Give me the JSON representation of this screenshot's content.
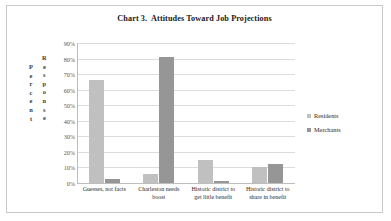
{
  "chart_data": {
    "type": "bar",
    "title": "Chart 3.  Attitudes Toward Job Projections",
    "xlabel": "",
    "ylabel": "Percent Response",
    "ylabel_lines": [
      "Percent",
      "Response"
    ],
    "categories": [
      "Guesses, not facts",
      "Charleston needs boost",
      "Historic district to get little benefit",
      "Historic district to share in benefit"
    ],
    "category_lines": [
      [
        "Guesses, not facts"
      ],
      [
        "Charleston needs",
        "boost"
      ],
      [
        "Historic district to",
        "get little benefit"
      ],
      [
        "Historic district to",
        "share in benefit"
      ]
    ],
    "series": [
      {
        "name": "Residents",
        "color": "#c0c0c0",
        "values": [
          66,
          5.5,
          15,
          10
        ]
      },
      {
        "name": "Merchants",
        "color": "#969696",
        "values": [
          2.5,
          81,
          1.5,
          12
        ]
      }
    ],
    "ylim": [
      0,
      90
    ],
    "ytick_step": 10,
    "ytick_labels": [
      "90%",
      "80%",
      "70%",
      "60%",
      "50%",
      "40%",
      "30%",
      "20%",
      "10%",
      "0%"
    ],
    "ytick_values": [
      90,
      80,
      70,
      60,
      50,
      40,
      30,
      20,
      10,
      0
    ],
    "grid": true,
    "legend_position": "right",
    "value_format": "percent"
  }
}
